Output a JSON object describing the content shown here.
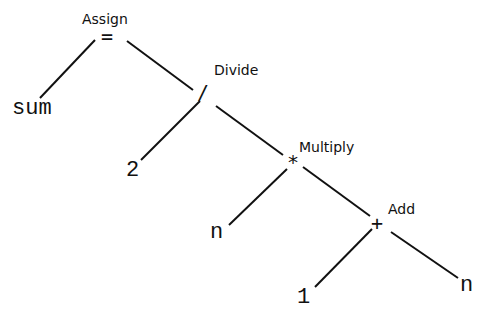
{
  "diagram": {
    "type": "expression-tree",
    "nodes": {
      "assign": {
        "label": "Assign",
        "symbol": "="
      },
      "divide": {
        "label": "Divide",
        "symbol": "/"
      },
      "multiply": {
        "label": "Multiply",
        "symbol": "*"
      },
      "add": {
        "label": "Add",
        "symbol": "+"
      }
    },
    "leaves": {
      "sum": "sum",
      "two": "2",
      "n1": "n",
      "one": "1",
      "n2": "n"
    },
    "edges": [
      {
        "from": "assign",
        "to": "sum",
        "x1": 95,
        "y1": 40,
        "x2": 40,
        "y2": 98
      },
      {
        "from": "assign",
        "to": "divide",
        "x1": 127,
        "y1": 41,
        "x2": 193,
        "y2": 90
      },
      {
        "from": "divide",
        "to": "two",
        "x1": 200,
        "y1": 101,
        "x2": 141,
        "y2": 160
      },
      {
        "from": "divide",
        "to": "multiply",
        "x1": 216,
        "y1": 106,
        "x2": 283,
        "y2": 155
      },
      {
        "from": "multiply",
        "to": "n1",
        "x1": 287,
        "y1": 169,
        "x2": 229,
        "y2": 225
      },
      {
        "from": "multiply",
        "to": "add",
        "x1": 303,
        "y1": 167,
        "x2": 370,
        "y2": 216
      },
      {
        "from": "add",
        "to": "one",
        "x1": 372,
        "y1": 229,
        "x2": 315,
        "y2": 287
      },
      {
        "from": "add",
        "to": "n2",
        "x1": 391,
        "y1": 232,
        "x2": 458,
        "y2": 278
      }
    ],
    "line_color": "#111111"
  }
}
